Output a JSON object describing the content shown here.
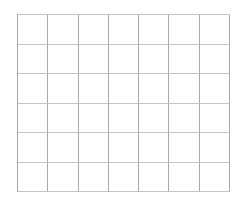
{
  "canvas": {
    "width": 243,
    "height": 205,
    "background": "#ffffff"
  },
  "grid": {
    "columns": 7,
    "rows": 6,
    "left": 17,
    "top": 14,
    "width": 213,
    "height": 178,
    "vertical_line_color": "#a9a9a9",
    "horizontal_line_color": "#c4c4c4",
    "cell_fill": "#ffffff",
    "cell_text": ""
  }
}
